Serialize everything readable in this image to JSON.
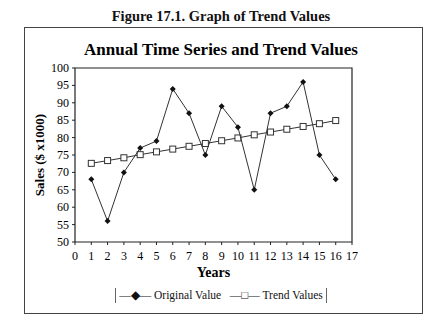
{
  "figure_title": "Figure 17.1. Graph of Trend Values",
  "chart_data": {
    "type": "line",
    "title": "Annual Time Series and Trend Values",
    "xlabel": "Years",
    "ylabel": "Sales ($ x1000)",
    "xlim": [
      0,
      17
    ],
    "ylim": [
      50,
      100
    ],
    "x_ticks": [
      0,
      1,
      2,
      3,
      4,
      5,
      6,
      7,
      8,
      9,
      10,
      11,
      12,
      13,
      14,
      15,
      16,
      17
    ],
    "y_ticks": [
      50,
      55,
      60,
      65,
      70,
      75,
      80,
      85,
      90,
      95,
      100
    ],
    "grid": false,
    "legend_position": "bottom",
    "x": [
      1,
      2,
      3,
      4,
      5,
      6,
      7,
      8,
      9,
      10,
      11,
      12,
      13,
      14,
      15,
      16
    ],
    "series": [
      {
        "name": "Original Value",
        "marker": "filled-diamond",
        "values": [
          68,
          56,
          70,
          77,
          79,
          94,
          87,
          75,
          89,
          83,
          65,
          87,
          89,
          96,
          75,
          68
        ]
      },
      {
        "name": "Trend Values",
        "marker": "open-square",
        "values": [
          72.6,
          73.4,
          74.2,
          75.1,
          75.9,
          76.7,
          77.5,
          78.3,
          79.1,
          79.9,
          80.8,
          81.6,
          82.4,
          83.2,
          84.0,
          84.9
        ]
      }
    ]
  },
  "legend": {
    "items": [
      {
        "label": "Original Value",
        "symbol": "—◆—"
      },
      {
        "label": "Trend Values",
        "symbol": "—□—"
      }
    ]
  }
}
